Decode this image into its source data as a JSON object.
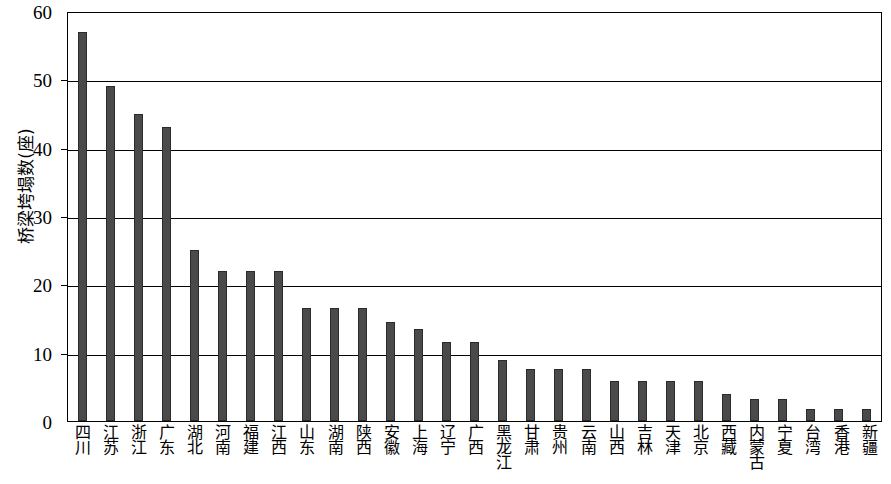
{
  "chart_data": {
    "type": "bar",
    "title": "",
    "subtitle": "",
    "xlabel": "",
    "ylabel": "桥梁垮塌数(座)",
    "ylim": [
      0,
      60
    ],
    "ytick_values": [
      0,
      10,
      20,
      30,
      40,
      50,
      60
    ],
    "ytick_labels": [
      "0",
      "10",
      "20",
      "30",
      "40",
      "50",
      "60"
    ],
    "grid": true,
    "grid_axis": "y",
    "legend": null,
    "bar_color": "#4a4a4a",
    "categories": [
      "四川",
      "江苏",
      "浙江",
      "广东",
      "湖北",
      "河南",
      "福建",
      "江西",
      "山东",
      "湖南",
      "陕西",
      "安徽",
      "上海",
      "辽宁",
      "广西",
      "黑龙江",
      "甘肃",
      "贵州",
      "云南",
      "山西",
      "吉林",
      "天津",
      "北京",
      "西藏",
      "内蒙古",
      "宁夏",
      "台湾",
      "香港",
      "新疆"
    ],
    "values": [
      57,
      49,
      45,
      43,
      25,
      22,
      22,
      22,
      16.5,
      16.5,
      16.5,
      14.5,
      13.5,
      11.5,
      11.5,
      9,
      7.6,
      7.6,
      7.6,
      5.9,
      5.9,
      5.9,
      5.9,
      4,
      3.2,
      3.2,
      1.8,
      1.8,
      1.8
    ]
  }
}
